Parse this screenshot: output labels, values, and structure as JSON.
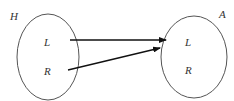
{
  "diagram": {
    "type": "mapping",
    "sets": [
      {
        "id": "H",
        "name": "H",
        "elements": [
          "L",
          "R"
        ]
      },
      {
        "id": "A",
        "name": "A",
        "elements": [
          "L",
          "R"
        ]
      }
    ],
    "arrows": [
      {
        "from": "H.L",
        "to": "A.L"
      },
      {
        "from": "H.R",
        "to": "A.L"
      }
    ],
    "colors": {
      "stroke": "#555555",
      "arrow": "#111111",
      "text": "#333333"
    }
  }
}
